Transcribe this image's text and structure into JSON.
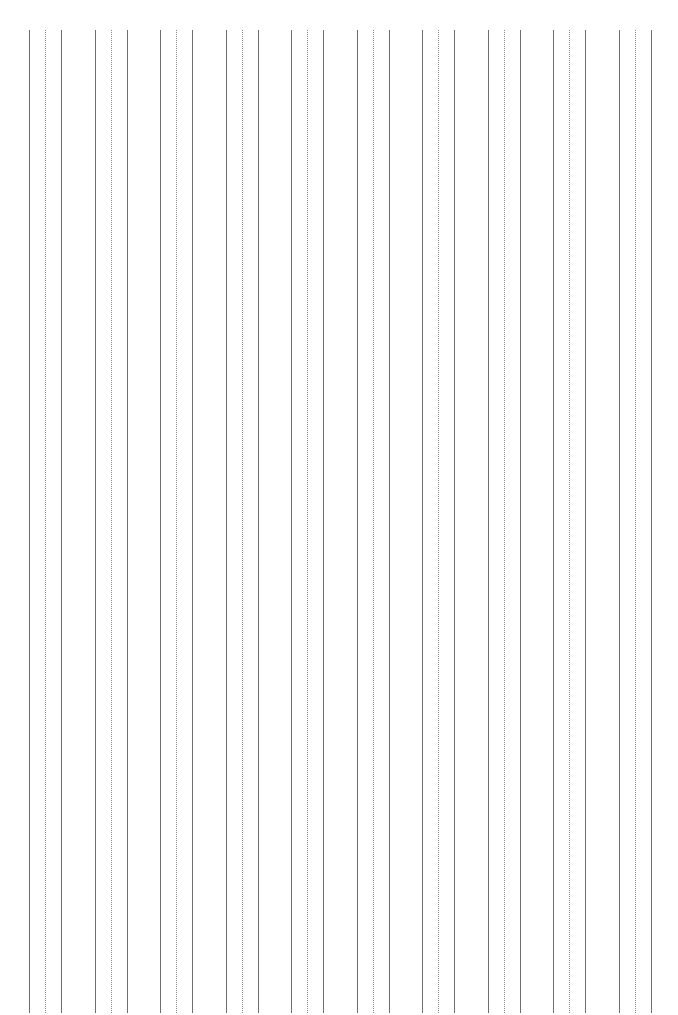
{
  "page": {
    "type": "ruled-guide-sheet",
    "background": "#ffffff",
    "line_color": "#6e6e6e",
    "dotted_color": "#8a8a8a",
    "line_top": 30,
    "line_bottom": 1013,
    "group_count": 10,
    "first_group_x": 29,
    "group_spacing": 65.5,
    "line_offsets": [
      0,
      16,
      32
    ],
    "line_styles": [
      "solid",
      "dotted",
      "solid"
    ]
  }
}
